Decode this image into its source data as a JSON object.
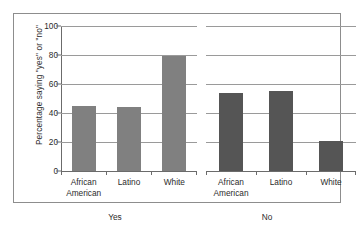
{
  "chart_data": {
    "type": "bar",
    "title": "",
    "xlabel": "",
    "ylabel": "Percentage saying \"yes\" or \"no\"",
    "ylim": [
      0,
      100
    ],
    "yticks": [
      0,
      20,
      40,
      60,
      80,
      100
    ],
    "grid": true,
    "legend": "none",
    "categories": [
      "African American",
      "Latino",
      "White"
    ],
    "panels": [
      {
        "label": "Yes",
        "color": "#808080",
        "categories": [
          "African American",
          "Latino",
          "White"
        ],
        "values": [
          45,
          44,
          79
        ]
      },
      {
        "label": "No",
        "color": "#555555",
        "categories": [
          "African American",
          "Latino",
          "White"
        ],
        "values": [
          54,
          55,
          21
        ]
      }
    ],
    "series": [
      {
        "name": "Yes",
        "values": [
          45,
          44,
          79
        ]
      },
      {
        "name": "No",
        "values": [
          54,
          55,
          21
        ]
      }
    ]
  },
  "axis": {
    "y_label": "Percentage saying \"yes\" or \"no\"",
    "ticks": [
      "100",
      "80",
      "60",
      "40",
      "20",
      "0"
    ]
  },
  "panel_yes": {
    "group_label": "Yes",
    "cat_0_line1": "African",
    "cat_0_line2": "American",
    "cat_1_line1": "Latino",
    "cat_1_line2": "",
    "cat_2_line1": "White",
    "cat_2_line2": ""
  },
  "panel_no": {
    "group_label": "No",
    "cat_0_line1": "African",
    "cat_0_line2": "American",
    "cat_1_line1": "Latino",
    "cat_1_line2": "",
    "cat_2_line1": "White",
    "cat_2_line2": ""
  },
  "colors": {
    "bar_yes": "#808080",
    "bar_no": "#555555",
    "gridline": "#9a9a9a",
    "frame": "#8d8d8d",
    "text": "#2b2b2b"
  }
}
